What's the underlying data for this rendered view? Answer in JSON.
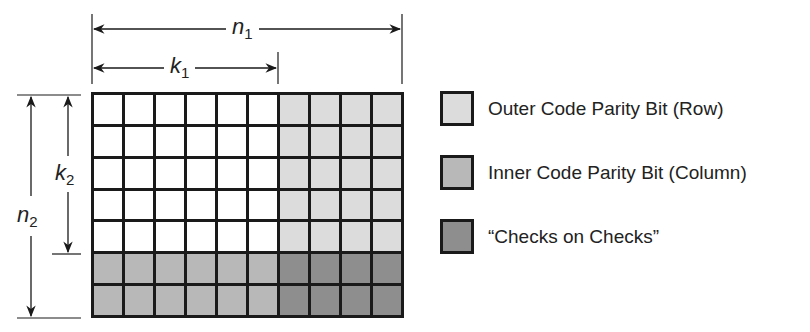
{
  "diagram": {
    "grid": {
      "columns": 10,
      "rows": 7,
      "data_columns": 6,
      "data_rows": 5,
      "cells": [
        [
          "data",
          "data",
          "data",
          "data",
          "data",
          "data",
          "outer",
          "outer",
          "outer",
          "outer"
        ],
        [
          "data",
          "data",
          "data",
          "data",
          "data",
          "data",
          "outer",
          "outer",
          "outer",
          "outer"
        ],
        [
          "data",
          "data",
          "data",
          "data",
          "data",
          "data",
          "outer",
          "outer",
          "outer",
          "outer"
        ],
        [
          "data",
          "data",
          "data",
          "data",
          "data",
          "data",
          "outer",
          "outer",
          "outer",
          "outer"
        ],
        [
          "data",
          "data",
          "data",
          "data",
          "data",
          "data",
          "outer",
          "outer",
          "outer",
          "outer"
        ],
        [
          "inner",
          "inner",
          "inner",
          "inner",
          "inner",
          "inner",
          "checks",
          "checks",
          "checks",
          "checks"
        ],
        [
          "inner",
          "inner",
          "inner",
          "inner",
          "inner",
          "inner",
          "checks",
          "checks",
          "checks",
          "checks"
        ]
      ]
    },
    "dimensions": {
      "n1": {
        "symbol": "n",
        "subscript": "1"
      },
      "k1": {
        "symbol": "k",
        "subscript": "1"
      },
      "n2": {
        "symbol": "n",
        "subscript": "2"
      },
      "k2": {
        "symbol": "k",
        "subscript": "2"
      }
    },
    "legend": [
      {
        "key": "outer",
        "label": "Outer Code Parity Bit (Row)",
        "color": "#dcdcdc"
      },
      {
        "key": "inner",
        "label": "Inner Code Parity Bit (Column)",
        "color": "#b8b8b8"
      },
      {
        "key": "checks",
        "label": "“Checks on Checks”",
        "color": "#8e8e8e"
      }
    ],
    "colors": {
      "data": "#ffffff",
      "outer": "#dcdcdc",
      "inner": "#b8b8b8",
      "checks": "#8e8e8e",
      "line": "#1a1a1a"
    }
  }
}
